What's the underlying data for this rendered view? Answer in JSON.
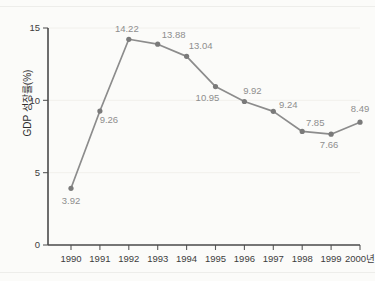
{
  "chart_data": {
    "type": "line",
    "title": "",
    "xlabel": "",
    "ylabel": "GDP 성장률(%)",
    "x_unit_suffix": "년",
    "categories": [
      "1990",
      "1991",
      "1992",
      "1993",
      "1994",
      "1995",
      "1996",
      "1997",
      "1998",
      "1999",
      "2000"
    ],
    "x_tick_labels": [
      "1990",
      "1991",
      "1992",
      "1993",
      "1994",
      "1995",
      "1996",
      "1997",
      "1998",
      "1999",
      "2000년"
    ],
    "values": [
      3.92,
      9.26,
      14.22,
      13.88,
      13.04,
      10.95,
      9.92,
      9.24,
      7.85,
      7.66,
      8.49
    ],
    "point_labels": [
      "3.92",
      "9.26",
      "14.22",
      "13.88",
      "13.04",
      "10.95",
      "9.92",
      "9.24",
      "7.85",
      "7.66",
      "8.49"
    ],
    "y_tick_labels": [
      "0",
      "5",
      "10",
      "15"
    ],
    "y_ticks": [
      0,
      5,
      10,
      15
    ],
    "ylim": [
      0,
      15.6
    ],
    "xlim": [
      -0.55,
      10.6
    ],
    "grid": false,
    "legend": "none",
    "series": [
      {
        "name": "GDP 성장률",
        "values": [
          3.92,
          9.26,
          14.22,
          13.88,
          13.04,
          10.95,
          9.92,
          9.24,
          7.85,
          7.66,
          8.49
        ]
      }
    ],
    "colors": {
      "line": "#8c8c8c",
      "marker": "#7a7a7a",
      "axis": "#4a4a4a",
      "tick_text": "#3d3d3d",
      "label_text": "#8e8e8e",
      "background": "#fbfbf9"
    }
  }
}
